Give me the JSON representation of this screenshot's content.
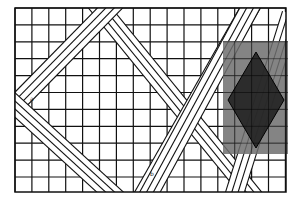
{
  "figure": {
    "type": "grid-diagram",
    "grid": {
      "x0": 15,
      "y0": 8,
      "x1": 286,
      "y1": 192,
      "cell": 16.9,
      "line_color": "#111111",
      "background": "#ffffff"
    },
    "bands": [
      {
        "name": "band-a",
        "from": [
          100,
          8
        ],
        "to": [
          250,
          192
        ],
        "strips": 3
      },
      {
        "name": "band-b",
        "from": [
          110,
          8
        ],
        "to": [
          15,
          105
        ],
        "strips": 3
      },
      {
        "name": "band-c",
        "from": [
          15,
          105
        ],
        "to": [
          110,
          192
        ],
        "strips": 3
      },
      {
        "name": "band-d",
        "from": [
          145,
          192
        ],
        "to": [
          250,
          8
        ],
        "strips": 3
      },
      {
        "name": "band-e",
        "from": [
          250,
          8
        ],
        "to": [
          150,
          192
        ],
        "strips": 3
      },
      {
        "name": "band-f",
        "from": [
          286,
          30
        ],
        "to": [
          235,
          192
        ],
        "strips": 3
      }
    ],
    "overlay_rect": {
      "x": 223,
      "y": 41,
      "w": 65,
      "h": 113,
      "color": "#6e6e6e",
      "opacity": 0.85
    },
    "overlay_diamond": {
      "top": [
        256,
        52
      ],
      "right": [
        284,
        100
      ],
      "bottom": [
        256,
        148
      ],
      "left": [
        228,
        100
      ],
      "color": "#222222"
    },
    "labels": [
      {
        "text": "a",
        "x": 30,
        "y": 101
      },
      {
        "text": "b",
        "x": 150,
        "y": 176
      }
    ]
  }
}
